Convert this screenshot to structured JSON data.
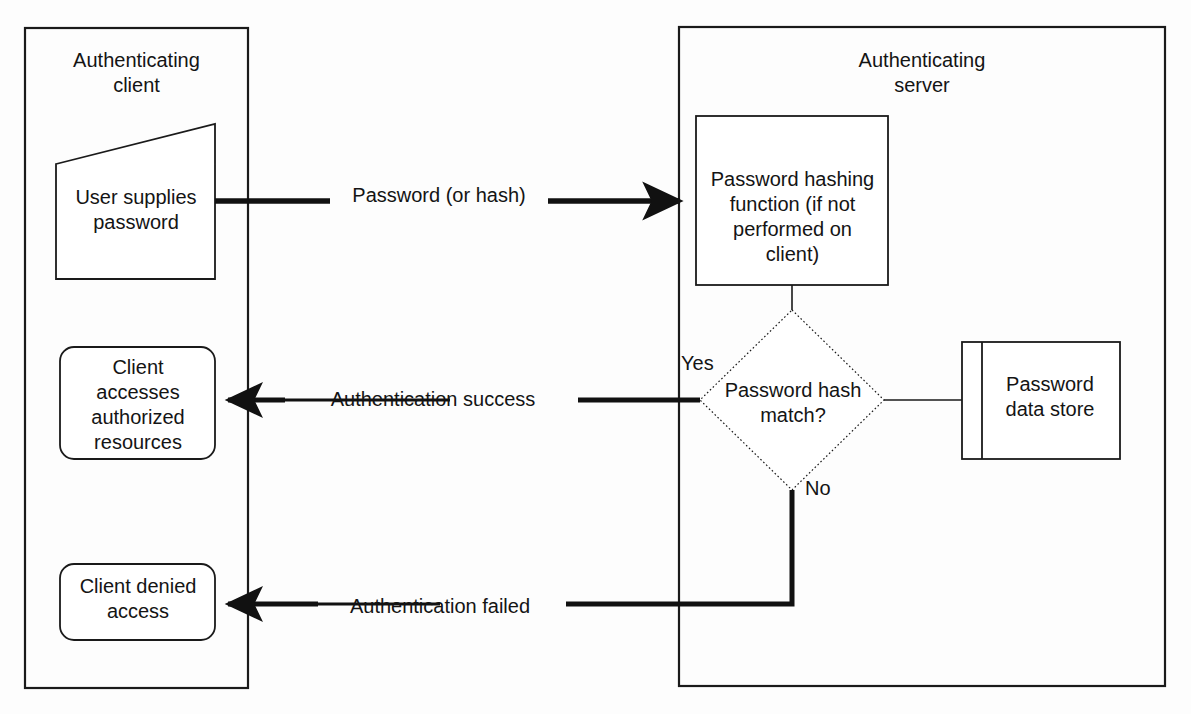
{
  "diagram": {
    "colors": {
      "stroke": "#1a1a1a",
      "background": "#ffffff",
      "flow_arrow": "#111111"
    },
    "containers": [
      {
        "id": "client",
        "label": "Authenticating\nclient"
      },
      {
        "id": "server",
        "label": "Authenticating\nserver"
      }
    ],
    "nodes": [
      {
        "id": "user-supplies-password",
        "shape": "parallelogram",
        "label": "User supplies\npassword"
      },
      {
        "id": "client-accesses-resources",
        "shape": "rounded-rectangle",
        "label": "Client\naccesses\nauthorized\nresources"
      },
      {
        "id": "client-denied-access",
        "shape": "rounded-rectangle",
        "label": "Client denied\naccess"
      },
      {
        "id": "password-hashing-function",
        "shape": "rectangle",
        "label": "Password hashing\nfunction (if not\nperformed on\nclient)"
      },
      {
        "id": "password-hash-match",
        "shape": "diamond",
        "label": "Password hash\nmatch?"
      },
      {
        "id": "password-data-store",
        "shape": "data-store",
        "label": "Password\ndata store"
      }
    ],
    "edges": [
      {
        "id": "password-or-hash",
        "label": "Password (or hash)",
        "from": "user-supplies-password",
        "to": "password-hashing-function",
        "style": "solid-thick-arrow"
      },
      {
        "id": "authentication-success",
        "label": "Authentication success",
        "from": "password-hash-match",
        "to": "client-accesses-resources",
        "style": "solid-thick-arrow"
      },
      {
        "id": "authentication-failed",
        "label": "Authentication failed",
        "from": "password-hash-match",
        "to": "client-denied-access",
        "style": "solid-thick-arrow"
      },
      {
        "id": "datastore-link",
        "label": "",
        "from": "password-hash-match",
        "to": "password-data-store",
        "style": "thin-line"
      },
      {
        "id": "hash-to-decision",
        "label": "",
        "from": "password-hashing-function",
        "to": "password-hash-match",
        "style": "thin-line"
      }
    ],
    "branch_labels": [
      {
        "id": "yes",
        "label": "Yes"
      },
      {
        "id": "no",
        "label": "No"
      }
    ]
  }
}
